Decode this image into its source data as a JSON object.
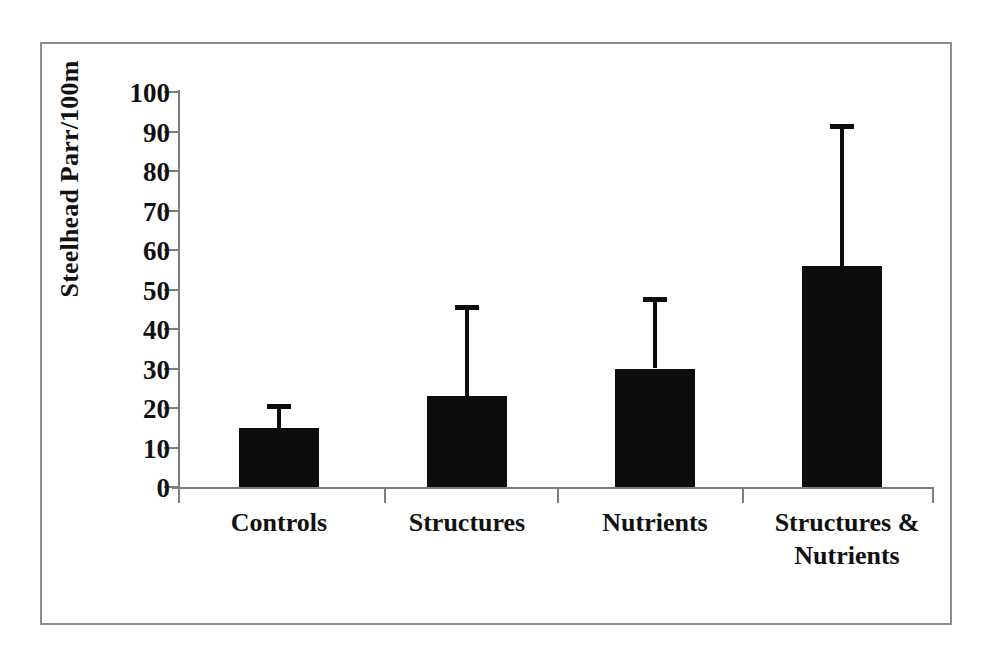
{
  "chart_data": {
    "type": "bar",
    "title": "",
    "xlabel": "",
    "ylabel": "Steelhead Parr/100m",
    "categories": [
      "Controls",
      "Structures",
      "Nutrients",
      "Structures & Nutrients"
    ],
    "category_lines": [
      [
        "Controls"
      ],
      [
        "Structures"
      ],
      [
        "Nutrients"
      ],
      [
        "Structures &",
        "Nutrients"
      ]
    ],
    "values": [
      15,
      23,
      30,
      56
    ],
    "error_upper": [
      21,
      46,
      48,
      92
    ],
    "ylim": [
      0,
      100
    ],
    "ytick_values": [
      0,
      10,
      20,
      30,
      40,
      50,
      60,
      70,
      80,
      90,
      100
    ],
    "ytick_labels": [
      "0",
      "10",
      "20",
      "30",
      "40",
      "50",
      "60",
      "70",
      "80",
      "90",
      "100"
    ],
    "grid": false,
    "legend": null,
    "legend_position": "none",
    "error_bar_style": "upper-only-capped",
    "bar_color": "#0d0d0d",
    "axis_color": "#7d7d7d",
    "background_color": "#ffffff",
    "frame_color": "#8e8e8e"
  }
}
